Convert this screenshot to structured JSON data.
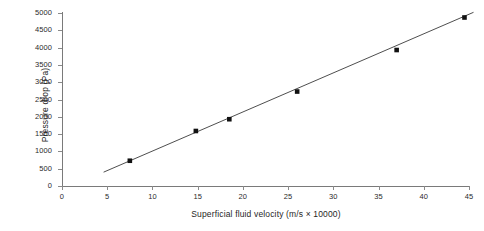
{
  "chart_data": {
    "type": "scatter",
    "title": "",
    "xlabel": "Superficial fluid velocity (m/s × 10000)",
    "ylabel": "Pressure drop (Pa)",
    "xlim": [
      0,
      45
    ],
    "ylim": [
      0,
      5000
    ],
    "xticks": [
      0,
      5,
      10,
      15,
      20,
      25,
      30,
      35,
      40,
      45
    ],
    "xtick_labels": [
      "0",
      "5",
      "10",
      "15",
      "20",
      "25",
      "30",
      "35",
      "40",
      "45"
    ],
    "yticks": [
      0,
      500,
      1000,
      1500,
      2000,
      2500,
      3000,
      3500,
      4000,
      4500,
      5000
    ],
    "ytick_labels": [
      "0",
      "500",
      "1000",
      "1500",
      "2000",
      "2500",
      "3000",
      "3500",
      "4000",
      "4500",
      "5000"
    ],
    "grid": false,
    "legend": "none",
    "marker": "filled-square",
    "marker_color": "#111111",
    "line_color": "#3a3a3a",
    "axis_color": "#7a7a7a",
    "series": [
      {
        "name": "Measured pressure drop",
        "marker": "filled-square",
        "x": [
          7.5,
          14.8,
          18.5,
          26.0,
          37.0,
          44.5
        ],
        "y": [
          730,
          1590,
          1930,
          2730,
          3930,
          4870
        ],
        "points": [
          {
            "x": 7.5,
            "y": 730
          },
          {
            "x": 14.8,
            "y": 1590
          },
          {
            "x": 18.5,
            "y": 1930
          },
          {
            "x": 26.0,
            "y": 2730
          },
          {
            "x": 37.0,
            "y": 3930
          },
          {
            "x": 44.5,
            "y": 4870
          }
        ]
      }
    ],
    "trendline": {
      "name": "Linear fit",
      "x": [
        4.6,
        45.5
      ],
      "y": [
        400,
        5020
      ]
    }
  }
}
